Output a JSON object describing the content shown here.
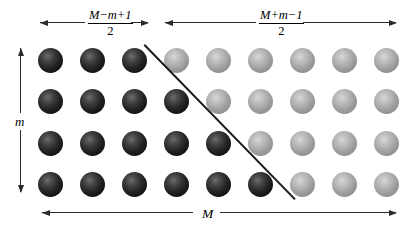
{
  "figure": {
    "background_color": "#ffffff",
    "line_color": "#2b2b2b",
    "dark_sphere_color": "#242424",
    "light_sphere_color": "#9d9d9d"
  },
  "labels": {
    "left_segment": {
      "numerator": "M−m+1",
      "denominator": "2"
    },
    "right_segment": {
      "numerator": "M+m−1",
      "denominator": "2"
    },
    "vertical": "m",
    "bottom": "M"
  },
  "grid": {
    "columns": 9,
    "rows": 4,
    "sphere_diameter": 25,
    "column_spacing": 42,
    "row_spacing": 41.5,
    "first_center_x": 50.5,
    "first_center_y": 60,
    "dark_counts_per_row": [
      3,
      4,
      5,
      6
    ],
    "rows_data": [
      [
        "dark",
        "dark",
        "dark",
        "light",
        "light",
        "light",
        "light",
        "light",
        "light"
      ],
      [
        "dark",
        "dark",
        "dark",
        "dark",
        "light",
        "light",
        "light",
        "light",
        "light"
      ],
      [
        "dark",
        "dark",
        "dark",
        "dark",
        "dark",
        "light",
        "light",
        "light",
        "light"
      ],
      [
        "dark",
        "dark",
        "dark",
        "dark",
        "dark",
        "dark",
        "light",
        "light",
        "light"
      ]
    ]
  },
  "diagonal": {
    "x1": 145,
    "y1": 44,
    "x2": 296,
    "y2": 199
  },
  "arrows": {
    "top_left": {
      "x": 40,
      "y": 22,
      "width": 108
    },
    "top_right": {
      "x": 165,
      "y": 22,
      "width": 231
    },
    "vertical": {
      "x": 20,
      "y": 48,
      "height": 144
    },
    "bottom": {
      "x": 42,
      "y": 212,
      "width": 354
    }
  }
}
